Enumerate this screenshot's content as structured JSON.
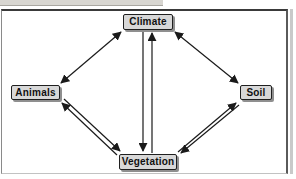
{
  "diagram": {
    "type": "concept-relationship-diagram",
    "nodes": [
      {
        "id": "climate",
        "label": "Climate"
      },
      {
        "id": "animals",
        "label": "Animals"
      },
      {
        "id": "soil",
        "label": "Soil"
      },
      {
        "id": "vegetation",
        "label": "Vegetation"
      }
    ],
    "edges": [
      {
        "from": "climate",
        "to": "animals",
        "direction": "bidirectional",
        "style": "single-line-two-heads"
      },
      {
        "from": "climate",
        "to": "soil",
        "direction": "bidirectional",
        "style": "single-line-two-heads"
      },
      {
        "from": "climate",
        "to": "vegetation",
        "direction": "bidirectional",
        "style": "two-parallel-one-way-arrows"
      },
      {
        "from": "animals",
        "to": "vegetation",
        "direction": "bidirectional",
        "style": "two-parallel-one-way-arrows"
      },
      {
        "from": "soil",
        "to": "vegetation",
        "direction": "bidirectional",
        "style": "two-parallel-one-way-arrows"
      }
    ],
    "colors": {
      "background": "#ffffff",
      "node_fill": "#d8d8d8",
      "node_border": "#1f1f1f",
      "node_shadow": "#8f8f8f",
      "arrow": "#1a1a1a",
      "frame_border": "#3a3a3a",
      "top_strip": "#d8d6d1"
    }
  }
}
